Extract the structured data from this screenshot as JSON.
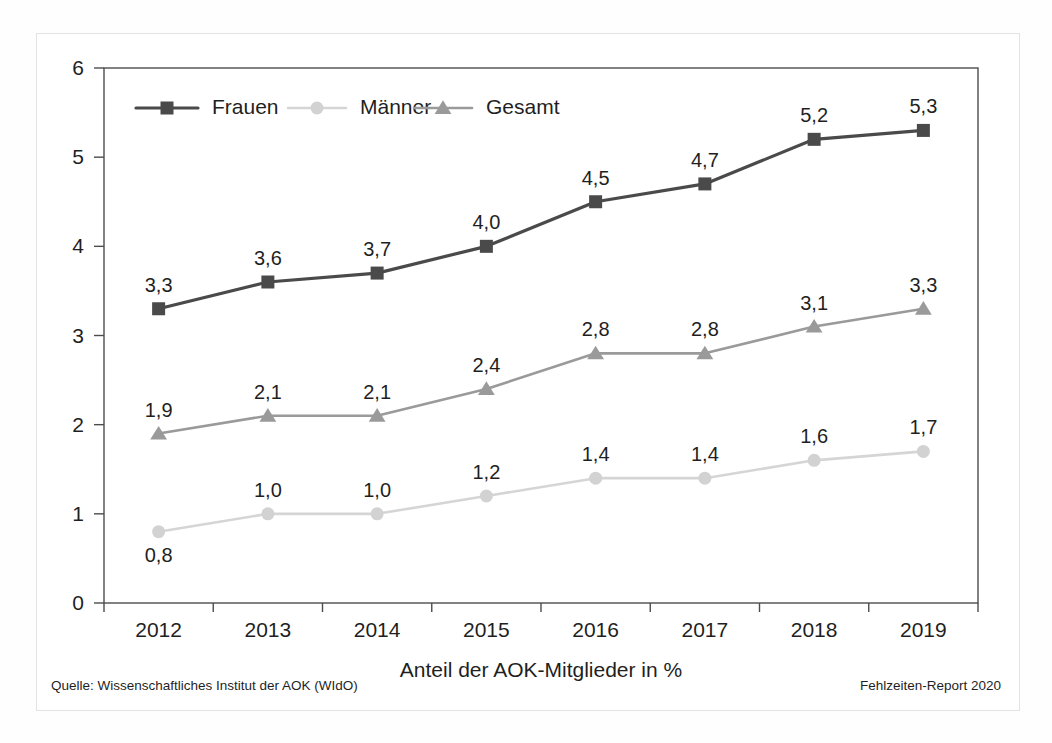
{
  "figure": {
    "source_note": "Quelle: Wissenschaftliches Institut der AOK (WIdO)",
    "report_note": "Fehlzeiten-Report 2020"
  },
  "colors": {
    "frauen": "#4a4a4a",
    "maenner": "#d2d2d2",
    "gesamt": "#9a9a9a",
    "axis": "#4d4d4d",
    "text": "#1f1f1f",
    "frame": "#e3e3e3",
    "background": "#ffffff"
  },
  "chart_data": {
    "type": "line",
    "title": "",
    "xlabel": "Anteil der AOK-Mitglieder in %",
    "ylabel": "",
    "categories": [
      "2012",
      "2013",
      "2014",
      "2015",
      "2016",
      "2017",
      "2018",
      "2019"
    ],
    "ylim": [
      0,
      6
    ],
    "yticks": [
      "0",
      "1",
      "2",
      "3",
      "4",
      "5",
      "6"
    ],
    "ytick_values": [
      0,
      1,
      2,
      3,
      4,
      5,
      6
    ],
    "grid": false,
    "legend_position": "top-left inside plot",
    "decimal_separator": ",",
    "series": [
      {
        "name": "Frauen",
        "marker": "square",
        "color": "#4a4a4a",
        "values": [
          3.3,
          3.6,
          3.7,
          4.0,
          4.5,
          4.7,
          5.2,
          5.3
        ],
        "labels": [
          "3,3",
          "3,6",
          "3,7",
          "4,0",
          "4,5",
          "4,7",
          "5,2",
          "5,3"
        ],
        "label_position": "above"
      },
      {
        "name": "Männer",
        "marker": "circle",
        "color": "#d2d2d2",
        "values": [
          0.8,
          1.0,
          1.0,
          1.2,
          1.4,
          1.4,
          1.6,
          1.7
        ],
        "labels": [
          "0,8",
          "1,0",
          "1,0",
          "1,2",
          "1,4",
          "1,4",
          "1,6",
          "1,7"
        ],
        "label_position": "above",
        "label_overrides": [
          {
            "index": 0,
            "position": "below"
          }
        ]
      },
      {
        "name": "Gesamt",
        "marker": "triangle",
        "color": "#9a9a9a",
        "values": [
          1.9,
          2.1,
          2.1,
          2.4,
          2.8,
          2.8,
          3.1,
          3.3
        ],
        "labels": [
          "1,9",
          "2,1",
          "2,1",
          "2,4",
          "2,8",
          "2,8",
          "3,1",
          "3,3"
        ],
        "label_position": "above"
      }
    ]
  }
}
